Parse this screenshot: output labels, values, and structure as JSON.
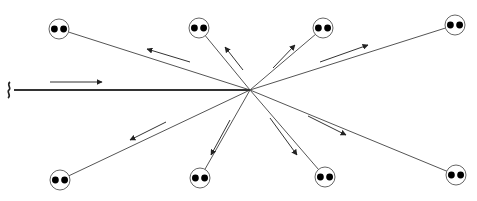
{
  "diagram": {
    "type": "scattering-rays",
    "canvas": {
      "width": 477,
      "height": 201
    },
    "center": {
      "x": 250,
      "y": 90
    },
    "incoming": {
      "from": {
        "x": 8,
        "y": 90
      },
      "arrow": {
        "x1": 50,
        "y1": 82,
        "x2": 102,
        "y2": 82
      }
    },
    "nodes": [
      {
        "id": "top-left",
        "x": 59,
        "y": 29,
        "arrow": {
          "x1": 190,
          "y1": 62,
          "x2": 147,
          "y2": 49
        }
      },
      {
        "id": "top-middle",
        "x": 199,
        "y": 28,
        "arrow": {
          "x1": 243,
          "y1": 70,
          "x2": 225,
          "y2": 47
        }
      },
      {
        "id": "top-right",
        "x": 323,
        "y": 28,
        "arrow": {
          "x1": 273,
          "y1": 68,
          "x2": 295,
          "y2": 45
        }
      },
      {
        "id": "far-right-top",
        "x": 455,
        "y": 25,
        "arrow": {
          "x1": 320,
          "y1": 62,
          "x2": 368,
          "y2": 45
        }
      },
      {
        "id": "bottom-left",
        "x": 60,
        "y": 180,
        "arrow": {
          "x1": 166,
          "y1": 122,
          "x2": 130,
          "y2": 140
        }
      },
      {
        "id": "bottom-middle",
        "x": 200,
        "y": 178,
        "arrow": {
          "x1": 230,
          "y1": 120,
          "x2": 211,
          "y2": 155
        }
      },
      {
        "id": "bottom-right",
        "x": 325,
        "y": 177,
        "arrow": {
          "x1": 270,
          "y1": 118,
          "x2": 297,
          "y2": 155
        }
      },
      {
        "id": "far-right-bottom",
        "x": 456,
        "y": 175,
        "arrow": {
          "x1": 308,
          "y1": 116,
          "x2": 346,
          "y2": 135
        }
      }
    ],
    "node_radius": 10,
    "eye_radius": 3.4,
    "eye_offset": 4.6,
    "colors": {
      "line": "#555555",
      "incoming": "#333333",
      "ring": "#666666",
      "eye": "#000000",
      "background": "#ffffff"
    }
  }
}
